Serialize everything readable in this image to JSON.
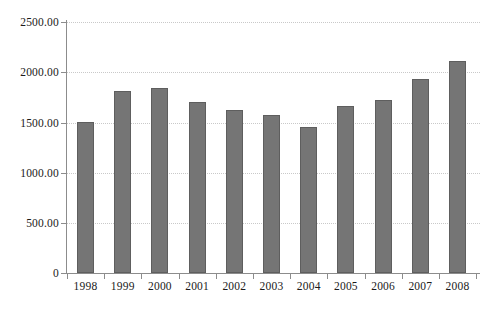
{
  "chart_data": {
    "type": "bar",
    "title": "",
    "subtitle": "",
    "xlabel": "",
    "ylabel": "",
    "categories": [
      "1998",
      "1999",
      "2000",
      "2001",
      "2002",
      "2003",
      "2004",
      "2005",
      "2006",
      "2007",
      "2008"
    ],
    "values": [
      1505,
      1815,
      1845,
      1705,
      1625,
      1575,
      1455,
      1665,
      1725,
      1935,
      2115
    ],
    "ylim": [
      0,
      2500
    ],
    "ytick_values": [
      0,
      500,
      1000,
      1500,
      2000,
      2500
    ],
    "ytick_labels": [
      "0",
      "500.00",
      "1000.00",
      "1500.00",
      "2000.00",
      "2500.00"
    ],
    "grid": true,
    "grid_axis": "y",
    "legend": false,
    "legend_position": "none",
    "series": [
      {
        "name": "",
        "values": [
          1505,
          1815,
          1845,
          1705,
          1625,
          1575,
          1455,
          1665,
          1725,
          1935,
          2115
        ]
      }
    ],
    "annotations": []
  },
  "style": {
    "bar_fill": "#757575",
    "bar_border": "#5e5e5e",
    "gridline_color": "#c9c9c9",
    "axis_color": "#8c8c8c",
    "text_color": "#1a1a1a",
    "background": "#ffffff"
  }
}
